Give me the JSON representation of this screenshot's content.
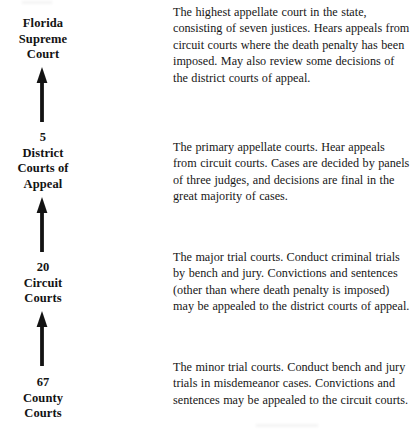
{
  "document": {
    "title": "Florida Court System Hierarchy",
    "background_color": "#ffffff",
    "ink_color": "#131313"
  },
  "diagram": {
    "type": "hierarchy-flow",
    "orientation": "bottom-to-top",
    "connector_icon": "up-arrow-icon",
    "levels": [
      {
        "id": "supreme-court",
        "count": "",
        "name_lines": [
          "Florida",
          "Supreme",
          "Court"
        ],
        "label": "Florida Supreme Court",
        "description": "The highest appellate court in the state, consisting of seven justices.  Hears appeals from circuit courts where the death penalty has been imposed.  May also review some decisions of the district courts of appeal."
      },
      {
        "id": "district-courts-of-appeal",
        "count": "5",
        "name_lines": [
          "5",
          "District",
          "Courts of",
          "Appeal"
        ],
        "label": "5 District Courts of Appeal",
        "description": "The primary appellate courts.  Hear appeals from circuit courts.  Cases are decided by panels of three judges, and decisions are final in the great majority of cases."
      },
      {
        "id": "circuit-courts",
        "count": "20",
        "name_lines": [
          "20",
          "Circuit",
          "Courts"
        ],
        "label": "20 Circuit Courts",
        "description": "The major trial courts.  Conduct criminal trials by bench and jury.  Convictions and sentences (other than where death penalty is imposed) may be appealed to the district courts of appeal."
      },
      {
        "id": "county-courts",
        "count": "67",
        "name_lines": [
          "67",
          "County",
          "Courts"
        ],
        "label": "67 County Courts",
        "description": "The minor trial courts.  Conduct bench and jury trials in misdemeanor cases. Convictions and sentences may be appealed to the circuit courts."
      }
    ],
    "connectors": [
      {
        "id": "arrow-county-to-circuit",
        "from": "county-courts",
        "to": "circuit-courts",
        "direction": "up"
      },
      {
        "id": "arrow-circuit-to-district",
        "from": "circuit-courts",
        "to": "district-courts-of-appeal",
        "direction": "up"
      },
      {
        "id": "arrow-district-to-supreme",
        "from": "district-courts-of-appeal",
        "to": "supreme-court",
        "direction": "up"
      }
    ]
  }
}
